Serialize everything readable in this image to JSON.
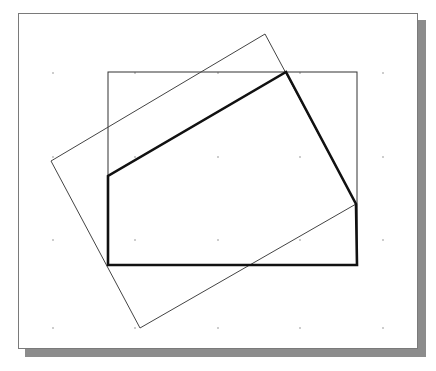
{
  "viewport": {
    "frame": {
      "x": 18,
      "y": 13,
      "width": 400,
      "height": 336,
      "border_color": "#7a7a7a"
    },
    "shadow": {
      "offset": 7,
      "color": "#8c8c8c"
    },
    "background": "#ffffff"
  },
  "grid": {
    "visible": true,
    "dot_color": "#9a9a9a",
    "xs": [
      53,
      135,
      218,
      300,
      383
    ],
    "ys": [
      73,
      157,
      240,
      328
    ]
  },
  "shapes": {
    "rectangle": {
      "label": "rectangle",
      "x": 108,
      "y": 72,
      "width": 249,
      "height": 193,
      "stroke": "#333333",
      "stroke_width": 1
    },
    "rotated_rectangle": {
      "label": "rotated-rectangle",
      "points": [
        [
          51,
          161
        ],
        [
          265,
          34
        ],
        [
          356,
          204
        ],
        [
          140,
          328
        ]
      ],
      "stroke": "#444444",
      "stroke_width": 1
    },
    "thick_outline": {
      "label": "intersection-outline",
      "points": [
        [
          108,
          265
        ],
        [
          108,
          176
        ],
        [
          286,
          72
        ],
        [
          356,
          204
        ],
        [
          357,
          265
        ]
      ],
      "stroke": "#111111",
      "stroke_width": 2.6
    }
  }
}
